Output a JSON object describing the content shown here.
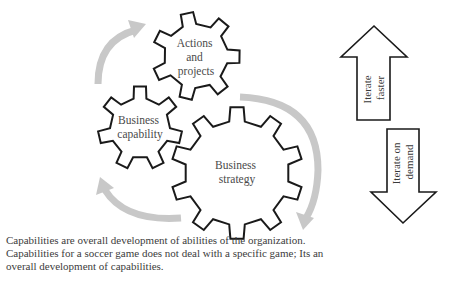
{
  "diagram": {
    "gears": [
      {
        "id": "actions-and-projects",
        "lines": [
          "Actions",
          "and",
          "projects"
        ]
      },
      {
        "id": "business-capability",
        "lines": [
          "Business",
          "capability"
        ]
      },
      {
        "id": "business-strategy",
        "lines": [
          "Business",
          "strategy"
        ]
      }
    ],
    "side_arrows": [
      {
        "id": "iterate-faster",
        "direction": "up",
        "lines": [
          "Iterate",
          "faster"
        ]
      },
      {
        "id": "iterate-on-demand",
        "direction": "down",
        "lines": [
          "Iterate on",
          "demand"
        ]
      }
    ],
    "cycle_arrows": [
      "capability-to-actions",
      "actions-to-strategy",
      "strategy-to-capability"
    ],
    "colors": {
      "gear_stroke": "#1a1a1a",
      "cycle_arrow": "#c8c8c8",
      "label_text": "#4a4a4a"
    }
  },
  "caption": {
    "lines": [
      "Capabilities are overall development of abilities of the organization.",
      "Capabilities for a soccer game does not deal with a specific game; Its an",
      "overall development of capabilities."
    ]
  }
}
